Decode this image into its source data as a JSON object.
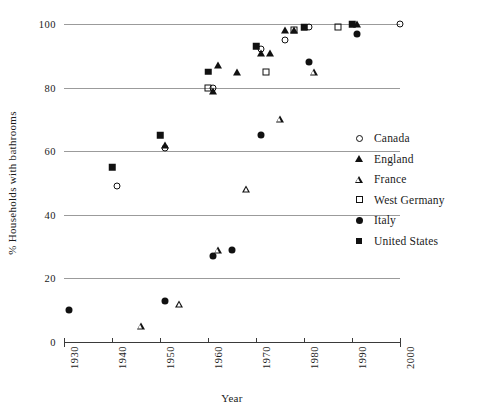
{
  "chart_data": {
    "type": "scatter",
    "title": "",
    "xlabel": "Year",
    "ylabel": "% Households with bathrooms",
    "xlim": [
      1930,
      2000
    ],
    "ylim": [
      0,
      100
    ],
    "xticks": [
      1930,
      1940,
      1950,
      1960,
      1970,
      1980,
      1990,
      2000
    ],
    "yticks": [
      0,
      20,
      40,
      60,
      80,
      100
    ],
    "grid": "horizontal",
    "legend_position": "right",
    "series": [
      {
        "name": "Canada",
        "marker": "circle-open",
        "points": [
          {
            "x": 1941,
            "y": 49
          },
          {
            "x": 1951,
            "y": 61
          },
          {
            "x": 1961,
            "y": 80
          },
          {
            "x": 1971,
            "y": 92
          },
          {
            "x": 1976,
            "y": 95
          },
          {
            "x": 1981,
            "y": 99
          },
          {
            "x": 2000,
            "y": 100
          }
        ]
      },
      {
        "name": "England",
        "marker": "triangle-filled",
        "points": [
          {
            "x": 1951,
            "y": 62
          },
          {
            "x": 1961,
            "y": 79
          },
          {
            "x": 1962,
            "y": 87
          },
          {
            "x": 1966,
            "y": 85
          },
          {
            "x": 1971,
            "y": 91
          },
          {
            "x": 1973,
            "y": 91
          },
          {
            "x": 1976,
            "y": 98
          },
          {
            "x": 1978,
            "y": 98
          },
          {
            "x": 1991,
            "y": 100
          }
        ]
      },
      {
        "name": "France",
        "marker": "triangle-open",
        "points": [
          {
            "x": 1946,
            "y": 5
          },
          {
            "x": 1954,
            "y": 12
          },
          {
            "x": 1962,
            "y": 29
          },
          {
            "x": 1968,
            "y": 48
          },
          {
            "x": 1975,
            "y": 70
          },
          {
            "x": 1982,
            "y": 85
          }
        ]
      },
      {
        "name": "West Germany",
        "marker": "square-open",
        "points": [
          {
            "x": 1960,
            "y": 80
          },
          {
            "x": 1972,
            "y": 85
          },
          {
            "x": 1978,
            "y": 98
          },
          {
            "x": 1987,
            "y": 99
          }
        ]
      },
      {
        "name": "Italy",
        "marker": "circle-filled",
        "points": [
          {
            "x": 1931,
            "y": 10
          },
          {
            "x": 1951,
            "y": 13
          },
          {
            "x": 1961,
            "y": 27
          },
          {
            "x": 1965,
            "y": 29
          },
          {
            "x": 1971,
            "y": 65
          },
          {
            "x": 1981,
            "y": 88
          },
          {
            "x": 1991,
            "y": 97
          }
        ]
      },
      {
        "name": "United States",
        "marker": "square-filled",
        "points": [
          {
            "x": 1940,
            "y": 55
          },
          {
            "x": 1950,
            "y": 65
          },
          {
            "x": 1960,
            "y": 85
          },
          {
            "x": 1970,
            "y": 93
          },
          {
            "x": 1980,
            "y": 99
          },
          {
            "x": 1990,
            "y": 100
          }
        ]
      }
    ]
  },
  "axes": {
    "y_title": "% Households with bathrooms",
    "x_title": "Year",
    "y_tick_labels": [
      "0",
      "20",
      "40",
      "60",
      "80",
      "100"
    ],
    "x_tick_labels": [
      "1930",
      "1940",
      "1950",
      "1960",
      "1970",
      "1980",
      "1990",
      "2000"
    ]
  },
  "legend": {
    "items": [
      {
        "label": "Canada",
        "marker": "circle-open"
      },
      {
        "label": "England",
        "marker": "triangle-filled"
      },
      {
        "label": "France",
        "marker": "triangle-open"
      },
      {
        "label": "West Germany",
        "marker": "square-open"
      },
      {
        "label": "Italy",
        "marker": "circle-filled"
      },
      {
        "label": "United States",
        "marker": "square-filled"
      }
    ]
  },
  "colors": {
    "marker": "#111111",
    "gridline": "#8a8a8a",
    "axis": "#3a3a3a",
    "background": "#ffffff"
  }
}
